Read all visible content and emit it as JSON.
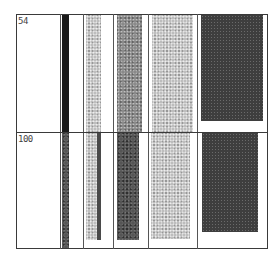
{
  "figure": {
    "row_labels": [
      "54",
      "100"
    ],
    "rows": [
      {
        "label": "54",
        "bars": [
          {
            "column": 1,
            "shade": "black",
            "x": 62,
            "width": 7,
            "top": 15,
            "bottom": 132
          },
          {
            "column": 2,
            "shade": "light-stipple",
            "x": 86,
            "width": 15,
            "top": 15,
            "bottom": 132
          },
          {
            "column": 3,
            "shade": "medium-stipple",
            "x": 117,
            "width": 25,
            "top": 15,
            "bottom": 132
          },
          {
            "column": 4,
            "shade": "light-stipple",
            "x": 152,
            "width": 41,
            "top": 15,
            "bottom": 132
          },
          {
            "column": 5,
            "shade": "dark-stipple",
            "x": 201,
            "width": 62,
            "top": 15,
            "bottom": 121
          }
        ]
      },
      {
        "label": "100",
        "bars": [
          {
            "column": 1,
            "shade": "dark",
            "x": 62,
            "width": 7,
            "top": 133,
            "bottom": 249
          },
          {
            "column": 2,
            "shade": "light-stipple-with-dark-edge",
            "x": 86,
            "width": 15,
            "top": 133,
            "bottom": 240
          },
          {
            "column": 3,
            "shade": "dark-stipple",
            "x": 117,
            "width": 22,
            "top": 133,
            "bottom": 240
          },
          {
            "column": 4,
            "shade": "light-stipple",
            "x": 151,
            "width": 39,
            "top": 133,
            "bottom": 239
          },
          {
            "column": 5,
            "shade": "dark-stipple",
            "x": 202,
            "width": 56,
            "top": 133,
            "bottom": 232
          }
        ]
      }
    ],
    "colors": {
      "border": "#3a3a3a",
      "black": "#1a1a1a",
      "dark": "#3e3e3e",
      "medium": "#8a8a8a",
      "light": "#bdbdbd"
    }
  }
}
